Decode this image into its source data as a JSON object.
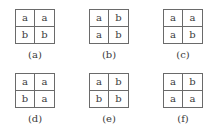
{
  "figure": {
    "panels": [
      {
        "label": "(a)",
        "cells": [
          "a",
          "a",
          "b",
          "b"
        ]
      },
      {
        "label": "(b)",
        "cells": [
          "a",
          "b",
          "a",
          "b"
        ]
      },
      {
        "label": "(c)",
        "cells": [
          "a",
          "a",
          "a",
          "b"
        ]
      },
      {
        "label": "(d)",
        "cells": [
          "a",
          "a",
          "b",
          "a"
        ]
      },
      {
        "label": "(e)",
        "cells": [
          "a",
          "b",
          "b",
          "b"
        ]
      },
      {
        "label": "(f)",
        "cells": [
          "a",
          "b",
          "a",
          "a"
        ]
      }
    ]
  }
}
